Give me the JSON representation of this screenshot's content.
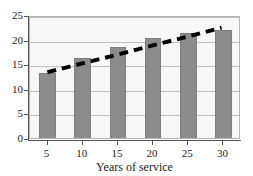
{
  "chart_data": {
    "type": "bar",
    "title": "",
    "subtitle": "",
    "xlabel": "Years of service",
    "ylabel": "",
    "categories": [
      "5",
      "10",
      "15",
      "20",
      "25",
      "30"
    ],
    "values": [
      13.3,
      16.3,
      18.6,
      20.4,
      21.4,
      22.0
    ],
    "series": [
      {
        "name": "Bars",
        "type": "bar",
        "values": [
          13.3,
          16.3,
          18.6,
          20.4,
          21.4,
          22.0
        ]
      },
      {
        "name": "Trend line",
        "type": "line",
        "style": "dashed",
        "color": "#000000",
        "values": [
          13.6,
          15.4,
          17.2,
          19.1,
          20.9,
          22.8
        ]
      }
    ],
    "xlim": [
      2.5,
      32.5
    ],
    "ylim": [
      0,
      25
    ],
    "yticks": [
      0,
      5,
      10,
      15,
      20,
      25
    ],
    "ytick_labels": [
      "0",
      "5",
      "10",
      "15",
      "20",
      "25"
    ],
    "xtick_labels": [
      "5",
      "10",
      "15",
      "20",
      "25",
      "30"
    ],
    "grid": true,
    "grid_axis": "y",
    "legend": false,
    "legend_position": "none",
    "bar_color": "#8c8c8c",
    "plot_background": "#f7f7f7",
    "axis_color": "#555555",
    "grid_color": "#c0c0c0",
    "annotations": []
  }
}
